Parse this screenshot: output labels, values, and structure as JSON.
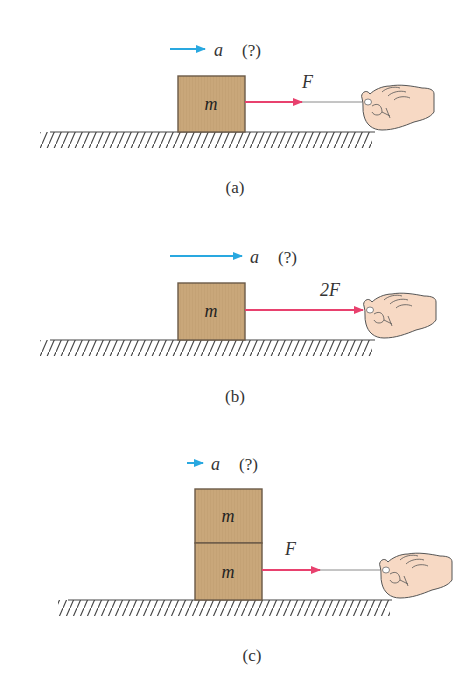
{
  "colors": {
    "box_fill": "#C9A77A",
    "box_stroke": "#6B5A48",
    "force_arrow": "#E8416E",
    "accel_arrow": "#29A8E0",
    "string": "#8A8A8A",
    "hand_fill": "#F7D9C4",
    "hand_stroke": "#555555",
    "ground": "#444444",
    "text": "#333333"
  },
  "panels": [
    {
      "id": "a",
      "caption": "(a)",
      "accel_label": "a",
      "accel_unknown": "(?)",
      "force_label": "F",
      "blocks": [
        {
          "label": "m"
        }
      ]
    },
    {
      "id": "b",
      "caption": "(b)",
      "accel_label": "a",
      "accel_unknown": "(?)",
      "force_label": "2F",
      "blocks": [
        {
          "label": "m"
        }
      ]
    },
    {
      "id": "c",
      "caption": "(c)",
      "accel_label": "a",
      "accel_unknown": "(?)",
      "force_label": "F",
      "blocks": [
        {
          "label": "m"
        },
        {
          "label": "m"
        }
      ]
    }
  ]
}
